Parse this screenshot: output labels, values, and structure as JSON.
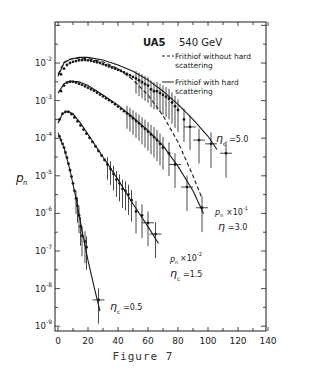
{
  "caption": "Figure 7",
  "chart_data": {
    "type": "line",
    "title": "UA5  540 GeV",
    "title_parts": {
      "experiment": "UA5",
      "energy": "540 GeV"
    },
    "xlabel": "",
    "ylabel": "p_n",
    "x_ticks": [
      "0",
      "20",
      "40",
      "60",
      "80",
      "100",
      "120",
      "140"
    ],
    "y_ticks": [
      "10^-2",
      "10^-3",
      "10^-4",
      "10^-5",
      "10^-6",
      "10^-7",
      "10^-8",
      "10^-9"
    ],
    "xlim": [
      0,
      140
    ],
    "ylim": [
      1e-09,
      0.1
    ],
    "yscale": "log",
    "grid": false,
    "legend": {
      "position": "upper right",
      "entries": [
        {
          "label": "Frithiof without hard scattering",
          "style": "dashed"
        },
        {
          "label": "Frithiof with hard scattering",
          "style": "solid"
        }
      ]
    },
    "annotations": [
      {
        "text": "η_c = 5.0",
        "near": "top curve"
      },
      {
        "text": "p_n × 10^-1",
        "near": "second curve"
      },
      {
        "text": "η = 3.0",
        "near": "second curve"
      },
      {
        "text": "p_n × 10^-2",
        "near": "third curve"
      },
      {
        "text": "η_c = 1.5",
        "near": "third curve"
      },
      {
        "text": "η_c = 0.5",
        "near": "bottom curve"
      }
    ],
    "series": [
      {
        "name": "η_c=5.0 data",
        "kind": "points",
        "x": [
          2,
          4,
          6,
          8,
          10,
          12,
          14,
          16,
          18,
          20,
          22,
          24,
          26,
          28,
          30,
          32,
          34,
          36,
          38,
          40,
          42,
          44,
          46,
          48,
          50,
          52,
          54,
          56,
          58,
          60,
          62,
          64,
          66,
          68,
          70,
          72,
          74,
          76,
          78,
          80,
          84,
          88,
          94,
          102,
          112
        ],
        "log10_y": [
          -2.3,
          -2.15,
          -2.05,
          -2.0,
          -1.97,
          -1.95,
          -1.93,
          -1.92,
          -1.92,
          -1.93,
          -1.94,
          -1.96,
          -1.98,
          -2.0,
          -2.03,
          -2.06,
          -2.09,
          -2.12,
          -2.15,
          -2.18,
          -2.21,
          -2.25,
          -2.29,
          -2.33,
          -2.37,
          -2.41,
          -2.46,
          -2.51,
          -2.56,
          -2.6,
          -2.7,
          -2.75,
          -2.75,
          -2.8,
          -2.85,
          -2.9,
          -2.95,
          -3.05,
          -3.15,
          -3.25,
          -3.5,
          -3.7,
          -4.05,
          -4.15,
          -4.4
        ]
      },
      {
        "name": "η_c=5.0 Frithiof with hard scattering",
        "kind": "solid",
        "x": [
          0,
          4,
          8,
          14,
          20,
          30,
          40,
          50,
          60,
          70,
          80,
          90,
          100,
          106
        ],
        "log10_y": [
          -2.35,
          -2.0,
          -1.9,
          -1.85,
          -1.85,
          -1.92,
          -2.05,
          -2.22,
          -2.45,
          -2.75,
          -3.1,
          -3.5,
          -3.95,
          -4.3
        ]
      },
      {
        "name": "η_c=5.0 Frithiof without hard scattering",
        "kind": "dashed",
        "x": [
          0,
          4,
          8,
          14,
          20,
          30,
          40,
          50,
          60,
          70,
          80,
          90,
          96
        ],
        "log10_y": [
          -2.3,
          -1.98,
          -1.9,
          -1.87,
          -1.88,
          -1.97,
          -2.15,
          -2.45,
          -2.85,
          -3.4,
          -4.1,
          -5.0,
          -5.6
        ]
      },
      {
        "name": "η=3.0 data (p_n × 10^-1)",
        "kind": "points",
        "x": [
          2,
          4,
          6,
          8,
          10,
          12,
          14,
          16,
          18,
          20,
          22,
          24,
          26,
          28,
          30,
          32,
          34,
          36,
          38,
          40,
          42,
          44,
          46,
          48,
          50,
          52,
          54,
          56,
          58,
          60,
          62,
          64,
          66,
          68,
          70,
          74,
          78,
          86,
          96
        ],
        "log10_y": [
          -2.75,
          -2.6,
          -2.52,
          -2.5,
          -2.5,
          -2.52,
          -2.55,
          -2.58,
          -2.62,
          -2.66,
          -2.7,
          -2.74,
          -2.79,
          -2.84,
          -2.89,
          -2.94,
          -2.99,
          -3.04,
          -3.1,
          -3.16,
          -3.22,
          -3.28,
          -3.34,
          -3.4,
          -3.47,
          -3.54,
          -3.6,
          -3.68,
          -3.75,
          -3.82,
          -3.9,
          -3.97,
          -4.05,
          -4.15,
          -4.25,
          -4.4,
          -4.7,
          -5.3,
          -5.85
        ]
      },
      {
        "name": "η=3.0 Frithiof (p_n × 10^-1)",
        "kind": "solid",
        "x": [
          0,
          4,
          8,
          14,
          20,
          30,
          40,
          50,
          60,
          70,
          80,
          90,
          97
        ],
        "log10_y": [
          -2.8,
          -2.55,
          -2.48,
          -2.5,
          -2.6,
          -2.85,
          -3.12,
          -3.45,
          -3.8,
          -4.2,
          -4.75,
          -5.4,
          -6.0
        ]
      },
      {
        "name": "η_c=1.5 data (p_n × 10^-2)",
        "kind": "points",
        "x": [
          1,
          3,
          5,
          7,
          9,
          11,
          13,
          15,
          17,
          19,
          21,
          23,
          25,
          27,
          29,
          31,
          33,
          35,
          37,
          39,
          41,
          43,
          45,
          47,
          49,
          52,
          56,
          60,
          65
        ],
        "log10_y": [
          -3.5,
          -3.35,
          -3.3,
          -3.3,
          -3.36,
          -3.45,
          -3.55,
          -3.66,
          -3.77,
          -3.88,
          -3.99,
          -4.1,
          -4.22,
          -4.34,
          -4.46,
          -4.58,
          -4.7,
          -4.82,
          -4.95,
          -5.1,
          -5.2,
          -5.35,
          -5.4,
          -5.5,
          -5.65,
          -5.95,
          -6.05,
          -6.25,
          -6.55
        ]
      },
      {
        "name": "η_c=1.5 Frithiof (p_n × 10^-2)",
        "kind": "solid",
        "x": [
          0,
          3,
          6,
          10,
          15,
          20,
          30,
          40,
          50,
          60,
          67
        ],
        "log10_y": [
          -3.6,
          -3.35,
          -3.28,
          -3.35,
          -3.6,
          -3.9,
          -4.5,
          -5.1,
          -5.75,
          -6.35,
          -6.8
        ]
      },
      {
        "name": "η_c=0.5 data",
        "kind": "points",
        "x": [
          1,
          2,
          3,
          4,
          5,
          6,
          7,
          8,
          9,
          10,
          11,
          12,
          13,
          14,
          15,
          16,
          18,
          19,
          27
        ],
        "log10_y": [
          -3.95,
          -4.05,
          -4.15,
          -4.25,
          -4.38,
          -4.52,
          -4.68,
          -4.85,
          -5.02,
          -5.2,
          -5.4,
          -5.6,
          -5.8,
          -6.05,
          -6.35,
          -6.6,
          -6.75,
          -6.9,
          -8.3
        ]
      },
      {
        "name": "η_c=0.5 Frithiof",
        "kind": "solid",
        "x": [
          0,
          4,
          8,
          12,
          16,
          20,
          24,
          28
        ],
        "log10_y": [
          -3.85,
          -4.25,
          -4.85,
          -5.6,
          -6.45,
          -7.25,
          -7.95,
          -8.6
        ]
      }
    ]
  }
}
